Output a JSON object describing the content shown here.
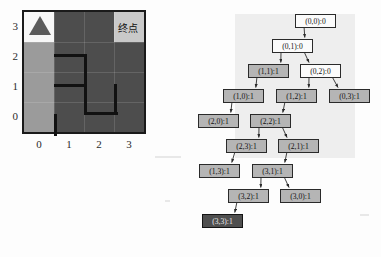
{
  "maze": {
    "title": "maze-grid",
    "x_ticks": [
      "0",
      "1",
      "2",
      "3"
    ],
    "y_ticks": [
      "3",
      "2",
      "1",
      "0"
    ],
    "goal_label": "终点",
    "start_marker": "triangle-robot",
    "colors": {
      "wall": "#4d4d4d",
      "path": "#9b9b9b",
      "start_cell": "#f7f7f7",
      "goal_cell": "#c9c9c9",
      "border": "#1a1a1a"
    },
    "cells": [
      {
        "col": 0,
        "row": 3,
        "shade": "white"
      },
      {
        "col": 1,
        "row": 3,
        "shade": "dark"
      },
      {
        "col": 2,
        "row": 3,
        "shade": "dark"
      },
      {
        "col": 3,
        "row": 3,
        "shade": "goal"
      },
      {
        "col": 0,
        "row": 2,
        "shade": "light"
      },
      {
        "col": 1,
        "row": 2,
        "shade": "dark"
      },
      {
        "col": 2,
        "row": 2,
        "shade": "dark"
      },
      {
        "col": 3,
        "row": 2,
        "shade": "dark"
      },
      {
        "col": 0,
        "row": 1,
        "shade": "light"
      },
      {
        "col": 1,
        "row": 1,
        "shade": "dark"
      },
      {
        "col": 2,
        "row": 1,
        "shade": "dark"
      },
      {
        "col": 3,
        "row": 1,
        "shade": "dark"
      },
      {
        "col": 0,
        "row": 0,
        "shade": "light"
      },
      {
        "col": 1,
        "row": 0,
        "shade": "dark"
      },
      {
        "col": 2,
        "row": 0,
        "shade": "dark"
      },
      {
        "col": 3,
        "row": 0,
        "shade": "dark"
      }
    ]
  },
  "tree": {
    "title": "search-tree",
    "nodes": [
      {
        "id": "n00",
        "label": "(0,0):0",
        "style": "white",
        "x": 105,
        "y": 14
      },
      {
        "id": "n01",
        "label": "(0,1):0",
        "style": "white",
        "x": 82,
        "y": 39
      },
      {
        "id": "n11",
        "label": "(1,1):1",
        "style": "grey",
        "x": 58,
        "y": 64
      },
      {
        "id": "n02",
        "label": "(0,2):0",
        "style": "white",
        "x": 110,
        "y": 64
      },
      {
        "id": "n10",
        "label": "(1,0):1",
        "style": "grey",
        "x": 33,
        "y": 89
      },
      {
        "id": "n12",
        "label": "(1,2):1",
        "style": "grey",
        "x": 86,
        "y": 89
      },
      {
        "id": "n03",
        "label": "(0,3):1",
        "style": "grey",
        "x": 139,
        "y": 89
      },
      {
        "id": "n20",
        "label": "(2,0):1",
        "style": "grey",
        "x": 8,
        "y": 114
      },
      {
        "id": "n22",
        "label": "(2,2):1",
        "style": "grey",
        "x": 60,
        "y": 114
      },
      {
        "id": "n23",
        "label": "(2,3):1",
        "style": "grey",
        "x": 36,
        "y": 139
      },
      {
        "id": "n21",
        "label": "(2,1):1",
        "style": "grey",
        "x": 88,
        "y": 139
      },
      {
        "id": "n13",
        "label": "(1,3):1",
        "style": "grey",
        "x": 9,
        "y": 164
      },
      {
        "id": "n31",
        "label": "(3,1):1",
        "style": "grey",
        "x": 62,
        "y": 164
      },
      {
        "id": "n32",
        "label": "(3,2):1",
        "style": "grey",
        "x": 38,
        "y": 189
      },
      {
        "id": "n30",
        "label": "(3,0):1",
        "style": "grey",
        "x": 90,
        "y": 189
      },
      {
        "id": "n33",
        "label": "(3,3):1",
        "style": "goal",
        "x": 12,
        "y": 214
      }
    ],
    "edges": [
      [
        "n00",
        "n01"
      ],
      [
        "n01",
        "n11"
      ],
      [
        "n01",
        "n02"
      ],
      [
        "n11",
        "n10"
      ],
      [
        "n02",
        "n12"
      ],
      [
        "n02",
        "n03"
      ],
      [
        "n10",
        "n20"
      ],
      [
        "n12",
        "n22"
      ],
      [
        "n22",
        "n23"
      ],
      [
        "n22",
        "n21"
      ],
      [
        "n23",
        "n13"
      ],
      [
        "n21",
        "n31"
      ],
      [
        "n31",
        "n32"
      ],
      [
        "n31",
        "n30"
      ],
      [
        "n32",
        "n33"
      ]
    ]
  }
}
